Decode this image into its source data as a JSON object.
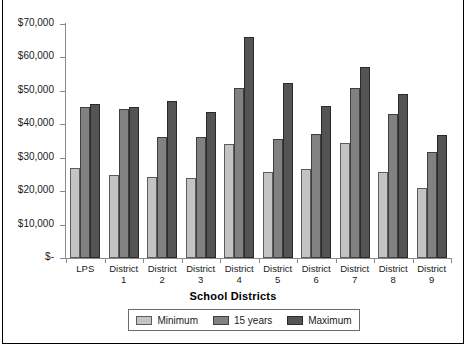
{
  "chart_data": {
    "type": "bar",
    "title": "",
    "xlabel": "School Districts",
    "ylabel": "",
    "ylim": [
      0,
      70000
    ],
    "ytick_values": [
      0,
      10000,
      20000,
      30000,
      40000,
      50000,
      60000,
      70000
    ],
    "ytick_labels": [
      "$-",
      "$10,000",
      "$20,000",
      "$30,000",
      "$40,000",
      "$50,000",
      "$60,000",
      "$70,000"
    ],
    "grid": false,
    "legend_position": "bottom",
    "categories": [
      "LPS",
      "District 1",
      "District 2",
      "District 3",
      "District 4",
      "District 5",
      "District 6",
      "District 7",
      "District 8",
      "District 9"
    ],
    "category_lines": [
      [
        "LPS",
        ""
      ],
      [
        "District",
        "1"
      ],
      [
        "District",
        "2"
      ],
      [
        "District",
        "3"
      ],
      [
        "District",
        "4"
      ],
      [
        "District",
        "5"
      ],
      [
        "District",
        "6"
      ],
      [
        "District",
        "7"
      ],
      [
        "District",
        "8"
      ],
      [
        "District",
        "9"
      ]
    ],
    "series": [
      {
        "name": "Minimum",
        "color": "#c3c3c3",
        "values": [
          27000,
          24800,
          24300,
          24000,
          34100,
          25600,
          26600,
          34400,
          25600,
          21000
        ]
      },
      {
        "name": "15 years",
        "color": "#818181",
        "values": [
          45300,
          44500,
          36200,
          36200,
          50800,
          35700,
          37000,
          50800,
          43000,
          31700
        ]
      },
      {
        "name": "Maximum",
        "color": "#545454",
        "values": [
          46200,
          45200,
          47000,
          43800,
          66000,
          52500,
          45400,
          57000,
          49000,
          36700
        ]
      }
    ]
  }
}
